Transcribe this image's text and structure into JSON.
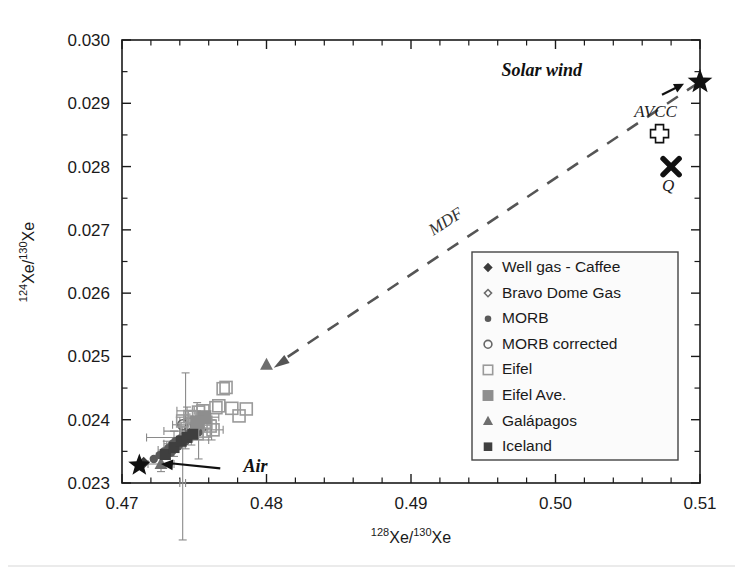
{
  "chart_data": {
    "type": "scatter",
    "title": "",
    "xlabel": "128Xe/130Xe",
    "ylabel": "124Xe/130Xe",
    "xlabel_parts": {
      "sup1": "128",
      "mid": "Xe/",
      "sup2": "130",
      "end": "Xe"
    },
    "ylabel_parts": {
      "sup1": "124",
      "mid": "Xe/",
      "sup2": "130",
      "end": "Xe"
    },
    "xlim": [
      0.47,
      0.51
    ],
    "ylim": [
      0.023,
      0.03
    ],
    "xticks": [
      "0.47",
      "0.48",
      "0.49",
      "0.50",
      "0.51"
    ],
    "xtick_values": [
      0.47,
      0.48,
      0.49,
      0.5,
      0.51
    ],
    "xminor_step": 0.002,
    "yticks": [
      "0.023",
      "0.024",
      "0.025",
      "0.026",
      "0.027",
      "0.028",
      "0.029",
      "0.030"
    ],
    "ytick_values": [
      0.023,
      0.024,
      0.025,
      0.026,
      0.027,
      0.028,
      0.029,
      0.03
    ],
    "yminor_step": 0.0005,
    "grid": false,
    "legend_position": "center-right",
    "series": [
      {
        "name": "Well gas - Caffee",
        "marker": "filled-diamond",
        "color": "#3a3a3a",
        "points": [
          [
            0.4715,
            0.02332
          ]
        ]
      },
      {
        "name": "Bravo Dome Gas",
        "marker": "open-diamond",
        "color": "#6b6b6b",
        "points": [
          [
            0.4738,
            0.0236
          ],
          [
            0.4741,
            0.02368
          ],
          [
            0.4745,
            0.02372
          ],
          [
            0.4749,
            0.02376
          ],
          [
            0.4752,
            0.02381
          ],
          [
            0.4755,
            0.02385
          ]
        ]
      },
      {
        "name": "MORB",
        "marker": "filled-circle",
        "color": "#5a5a5a",
        "points": [
          [
            0.4722,
            0.02338
          ],
          [
            0.4726,
            0.02344
          ],
          [
            0.4729,
            0.0235
          ],
          [
            0.4732,
            0.02355
          ],
          [
            0.4735,
            0.02362
          ],
          [
            0.4737,
            0.02366
          ],
          [
            0.474,
            0.0237
          ],
          [
            0.4743,
            0.02374
          ],
          [
            0.4746,
            0.02378
          ],
          [
            0.4748,
            0.02381
          ],
          [
            0.4751,
            0.02384
          ],
          [
            0.4753,
            0.0238
          ],
          [
            0.4744,
            0.02366
          ],
          [
            0.4739,
            0.02358
          ],
          [
            0.4734,
            0.02348
          ]
        ]
      },
      {
        "name": "MORB corrected",
        "marker": "open-circle",
        "color": "#666666",
        "points": [
          [
            0.4742,
            0.02392
          ],
          [
            0.4747,
            0.02386
          ],
          [
            0.4751,
            0.0239
          ]
        ]
      },
      {
        "name": "Eifel",
        "marker": "open-square",
        "color": "#9a9a9a",
        "points": [
          [
            0.4742,
            0.02398
          ],
          [
            0.4747,
            0.02405
          ],
          [
            0.475,
            0.02404
          ],
          [
            0.4753,
            0.02412
          ],
          [
            0.4756,
            0.02414
          ],
          [
            0.4758,
            0.02396
          ],
          [
            0.4761,
            0.0239
          ],
          [
            0.4765,
            0.02419
          ],
          [
            0.4767,
            0.02422
          ],
          [
            0.477,
            0.02449
          ],
          [
            0.4772,
            0.02451
          ],
          [
            0.4776,
            0.02418
          ],
          [
            0.4781,
            0.02406
          ],
          [
            0.4786,
            0.02417
          ],
          [
            0.4745,
            0.02386
          ],
          [
            0.4752,
            0.02378
          ],
          [
            0.4757,
            0.02382
          ],
          [
            0.4763,
            0.02384
          ],
          [
            0.4749,
            0.02394
          ]
        ]
      },
      {
        "name": "Eifel Ave.",
        "marker": "filled-square-gray",
        "color": "#8e8e8e",
        "points": [
          [
            0.4757,
            0.02404
          ],
          [
            0.4752,
            0.02396
          ]
        ]
      },
      {
        "name": "Galápagos",
        "marker": "filled-triangle",
        "color": "#6e6e6e",
        "points": [
          [
            0.4727,
            0.0233
          ],
          [
            0.48,
            0.02487
          ]
        ]
      },
      {
        "name": "Iceland",
        "marker": "filled-square-dark",
        "color": "#3f3f3f",
        "points": [
          [
            0.473,
            0.02345
          ],
          [
            0.4736,
            0.02356
          ],
          [
            0.4741,
            0.02366
          ],
          [
            0.4745,
            0.02372
          ],
          [
            0.4749,
            0.02377
          ]
        ]
      }
    ],
    "reference_points": [
      {
        "label": "Solar wind",
        "marker": "star",
        "x": 0.51,
        "y": 0.02934,
        "label_dx": -118,
        "label_dy": -6
      },
      {
        "label": "AVCC",
        "marker": "open-cross",
        "x": 0.5072,
        "y": 0.02852,
        "label_dx": -4,
        "label_dy": -17
      },
      {
        "label": "Q",
        "marker": "bold-x",
        "x": 0.508,
        "y": 0.028,
        "label_dx": -3,
        "label_dy": 24
      },
      {
        "label": "Air",
        "marker": "star",
        "x": 0.4712,
        "y": 0.02328,
        "label_dx": 0,
        "label_dy": 0
      }
    ],
    "annotations": [
      {
        "text": "MDF",
        "x": 0.4926,
        "y": 0.02706,
        "rotation": -33
      }
    ],
    "mdf_line": {
      "from": [
        0.4805,
        0.02482
      ],
      "to": [
        0.51,
        0.02934
      ],
      "style": "dashed",
      "arrow": "start"
    },
    "air_arrow": {
      "from": [
        0.4768,
        0.02323
      ],
      "to": [
        0.4727,
        0.0233
      ],
      "label": "Air"
    }
  },
  "legend": {
    "items": [
      {
        "label": "Well gas - Caffee",
        "marker": "filled-diamond"
      },
      {
        "label": "Bravo Dome Gas",
        "marker": "open-diamond"
      },
      {
        "label": "MORB",
        "marker": "filled-circle"
      },
      {
        "label": "MORB corrected",
        "marker": "open-circle"
      },
      {
        "label": "Eifel",
        "marker": "open-square"
      },
      {
        "label": "Eifel Ave.",
        "marker": "filled-square-gray"
      },
      {
        "label": "Galápagos",
        "marker": "filled-triangle"
      },
      {
        "label": "Iceland",
        "marker": "filled-square-dark"
      }
    ]
  },
  "axis": {
    "x_ticklabels": [
      "0.47",
      "0.48",
      "0.49",
      "0.50",
      "0.51"
    ],
    "y_ticklabels": [
      "0.023",
      "0.024",
      "0.025",
      "0.026",
      "0.027",
      "0.028",
      "0.029",
      "0.030"
    ],
    "x_title_sup1": "128",
    "x_title_mid": "Xe/",
    "x_title_sup2": "130",
    "x_title_end": "Xe",
    "y_title_sup1": "124",
    "y_title_mid": "Xe/",
    "y_title_sup2": "130",
    "y_title_end": "Xe"
  },
  "labels": {
    "solar_wind": "Solar wind",
    "avcc": "AVCC",
    "q": "Q",
    "air": "Air",
    "mdf": "MDF"
  },
  "colors": {
    "axis": "#1a1a1a",
    "dashed_line": "#555555",
    "eifel_open": "#9a9a9a",
    "eifel_ave": "#8e8e8e",
    "iceland": "#3f3f3f",
    "morb": "#5a5a5a",
    "star": "#111111",
    "legend_border": "#444444",
    "legend_fill": "#fbfbfb"
  }
}
